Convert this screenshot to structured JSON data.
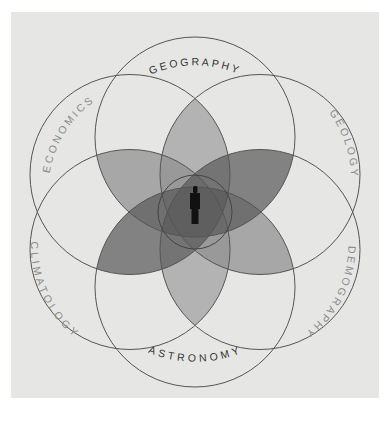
{
  "diagram": {
    "title": "",
    "center_figure": "person-silhouette",
    "disciplines": [
      {
        "id": "geography",
        "label": "GEOGRAPHY",
        "position": "top"
      },
      {
        "id": "geology",
        "label": "GEOLOGY",
        "position": "upper-right"
      },
      {
        "id": "demography",
        "label": "DEMOGRAPHY",
        "position": "lower-right"
      },
      {
        "id": "astronomy",
        "label": "ASTRONOMY",
        "position": "bottom"
      },
      {
        "id": "climatology",
        "label": "CLIMATOLOGY",
        "position": "lower-left"
      },
      {
        "id": "economics",
        "label": "ECONOMICS",
        "position": "upper-left"
      }
    ],
    "colors": {
      "background": "#e6e6e4",
      "ring_stroke": "#555555",
      "petal_light": "#a9a9a9",
      "petal_medium": "#9a9a9a",
      "petal_dark": "#6f6f6f",
      "figure": "#111111"
    }
  }
}
